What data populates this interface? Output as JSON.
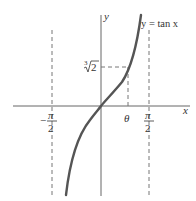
{
  "figure": {
    "type": "function-graph",
    "function_label": "y = tan x",
    "axes": {
      "x_label": "x",
      "y_label": "y"
    },
    "x_ticks": [
      {
        "label_num": "π",
        "label_den": "2",
        "sign": "−",
        "value": "-π/2"
      },
      {
        "label": "θ",
        "value": "θ"
      },
      {
        "label_num": "π",
        "label_den": "2",
        "sign": "",
        "value": "π/2"
      }
    ],
    "y_ticks": [
      {
        "label_index": "3",
        "label_radicand": "2",
        "value": "∛2"
      }
    ],
    "asymptotes": [
      "x = -π/2",
      "x = π/2"
    ],
    "colors": {
      "curve": "#555555",
      "axes": "#666666",
      "dashed": "#777777"
    }
  }
}
